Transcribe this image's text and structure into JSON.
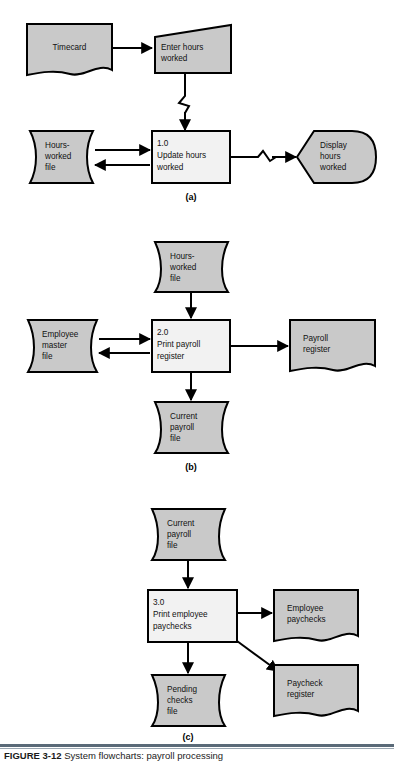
{
  "figure": {
    "caption_label": "FIGURE 3-12",
    "caption_text": "System flowcharts: payroll processing",
    "part_labels": [
      "(a)",
      "(b)",
      "(c)"
    ],
    "colors": {
      "shape_fill": "#c9c9c9",
      "process_fill": "#f2f2f2",
      "line": "#000000",
      "caption_rule": "#5a6a78"
    }
  },
  "panel_a": {
    "label": "(a)",
    "nodes": {
      "timecard": {
        "text": "Timecard",
        "shape": "document"
      },
      "enter_hours": {
        "line1": "Enter hours",
        "line2": "worked",
        "shape": "manual-input"
      },
      "hours_worked_file": {
        "line1": "Hours-",
        "line2": "worked",
        "line3": "file",
        "shape": "magnetic-disk"
      },
      "process_1": {
        "line1": "1.0",
        "line2": "Update hours",
        "line3": "worked",
        "shape": "process"
      },
      "display_hours": {
        "line1": "Display",
        "line2": "hours",
        "line3": "worked",
        "shape": "display"
      }
    }
  },
  "panel_b": {
    "label": "(b)",
    "nodes": {
      "hours_worked_file": {
        "line1": "Hours-",
        "line2": "worked",
        "line3": "file",
        "shape": "magnetic-disk"
      },
      "employee_master_file": {
        "line1": "Employee",
        "line2": "master",
        "line3": "file",
        "shape": "magnetic-disk"
      },
      "process_2": {
        "line1": "2.0",
        "line2": "Print payroll",
        "line3": "register",
        "shape": "process"
      },
      "payroll_register": {
        "line1": "Payroll",
        "line2": "register",
        "shape": "document"
      },
      "current_payroll_file": {
        "line1": "Current",
        "line2": "payroll",
        "line3": "file",
        "shape": "magnetic-disk"
      }
    }
  },
  "panel_c": {
    "label": "(c)",
    "nodes": {
      "current_payroll_file": {
        "line1": "Current",
        "line2": "payroll",
        "line3": "file",
        "shape": "magnetic-disk"
      },
      "process_3": {
        "line1": "3.0",
        "line2": "Print employee",
        "line3": "paychecks",
        "shape": "process"
      },
      "employee_paychecks": {
        "line1": "Employee",
        "line2": "paychecks",
        "shape": "document"
      },
      "pending_checks_file": {
        "line1": "Pending",
        "line2": "checks",
        "line3": "file",
        "shape": "magnetic-disk"
      },
      "paycheck_register": {
        "line1": "Paycheck",
        "line2": "register",
        "shape": "document"
      }
    }
  }
}
